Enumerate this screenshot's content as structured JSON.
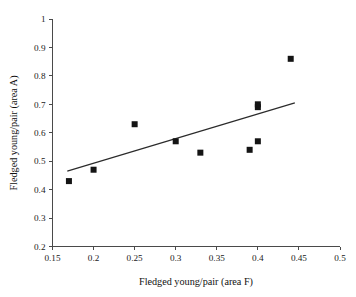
{
  "chart_data": {
    "type": "scatter",
    "title": "",
    "xlabel": "Fledged young/pair (area F)",
    "ylabel": "Fledged young/pair (area A)",
    "xlim": [
      0.15,
      0.5
    ],
    "ylim": [
      0.2,
      1.0
    ],
    "grid": false,
    "legend": null,
    "xticks": [
      "0.15",
      "0.2",
      "0.25",
      "0.3",
      "0.35",
      "0.4",
      "0.45",
      "0.5"
    ],
    "xtick_values": [
      0.15,
      0.2,
      0.25,
      0.3,
      0.35,
      0.4,
      0.45,
      0.5
    ],
    "yticks": [
      "0.2",
      "0.3",
      "0.4",
      "0.5",
      "0.6",
      "0.7",
      "0.8",
      "0.9",
      "1"
    ],
    "ytick_values": [
      0.2,
      0.3,
      0.4,
      0.5,
      0.6,
      0.7,
      0.8,
      0.9,
      1.0
    ],
    "marker": "square",
    "marker_color": "#141414",
    "marker_size": 6,
    "points": [
      {
        "x": 0.17,
        "y": 0.43
      },
      {
        "x": 0.2,
        "y": 0.47
      },
      {
        "x": 0.25,
        "y": 0.63
      },
      {
        "x": 0.3,
        "y": 0.57
      },
      {
        "x": 0.33,
        "y": 0.53
      },
      {
        "x": 0.39,
        "y": 0.54
      },
      {
        "x": 0.4,
        "y": 0.57
      },
      {
        "x": 0.4,
        "y": 0.69
      },
      {
        "x": 0.4,
        "y": 0.7
      },
      {
        "x": 0.44,
        "y": 0.86
      }
    ],
    "series": [
      {
        "name": "observations",
        "x": [
          0.17,
          0.2,
          0.25,
          0.3,
          0.33,
          0.39,
          0.4,
          0.4,
          0.4,
          0.44
        ],
        "values": [
          0.43,
          0.47,
          0.63,
          0.57,
          0.53,
          0.54,
          0.57,
          0.69,
          0.7,
          0.86
        ]
      }
    ],
    "trendline": {
      "type": "linear",
      "color": "#2b2b2b",
      "x_start": 0.168,
      "y_start": 0.465,
      "x_end": 0.445,
      "y_end": 0.705
    }
  }
}
